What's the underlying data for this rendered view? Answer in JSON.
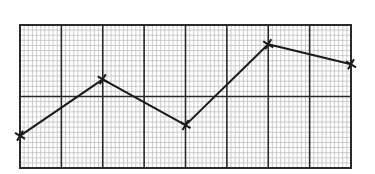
{
  "chart_data": {
    "type": "line",
    "title": "",
    "xlabel": "",
    "ylabel": "",
    "grid": true,
    "grid_major": {
      "columns": 8,
      "rows": 2
    },
    "grid_minor": {
      "per_column": 10,
      "per_row": 14
    },
    "xlim": [
      0,
      8
    ],
    "ylim": [
      0,
      2
    ],
    "x": [
      0,
      2,
      4,
      6,
      8
    ],
    "series": [
      {
        "name": "series-1",
        "values": [
          0.45,
          1.24,
          0.6,
          1.73,
          1.45
        ],
        "marker": "x",
        "color": "#1a1a1a"
      }
    ],
    "legend": null
  },
  "style": {
    "line_color": "#1a1a1a",
    "major_grid_color": "#2a2a2a",
    "minor_grid_color": "#b8b8b8",
    "background": "#ffffff"
  }
}
